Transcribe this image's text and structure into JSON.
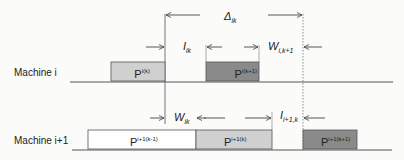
{
  "diagram": {
    "colors": {
      "background": "#fbfbfa",
      "line": "#444444",
      "box_light": "#d0d0d0",
      "box_dark": "#8a8a8a",
      "box_white": "#ffffff"
    },
    "rows": [
      {
        "label": "Machine i",
        "boxes": [
          {
            "base": "P",
            "sup": "i(k)",
            "fill": "light"
          },
          {
            "base": "P",
            "sup": "i(k+1)",
            "fill": "dark"
          }
        ]
      },
      {
        "label": "Machine i+1",
        "boxes": [
          {
            "base": "P",
            "sup": "i+1(k-1)",
            "fill": "white"
          },
          {
            "base": "P",
            "sup": "i+1(k)",
            "fill": "light"
          },
          {
            "base": "P",
            "sup": "i+1(k+1)",
            "fill": "dark"
          }
        ]
      }
    ],
    "intervals": {
      "delta": {
        "base": "Δ",
        "sub": "ik"
      },
      "idle_i": {
        "base": "I",
        "sub": "ik"
      },
      "wait_i": {
        "base": "W",
        "sub": "i,k+1"
      },
      "wait_i1": {
        "base": "W",
        "sub": "ik"
      },
      "idle_i1": {
        "base": "I",
        "sub": "i+1,k"
      }
    }
  }
}
